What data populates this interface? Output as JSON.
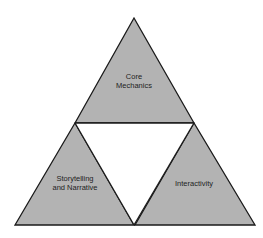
{
  "diagram": {
    "title": "",
    "fill_color": "#b3b3b3",
    "stroke_color": "#1a1a1a",
    "triangles": [
      {
        "id": "top",
        "label_lines": [
          "Core",
          "Mechanics"
        ]
      },
      {
        "id": "bottom-left",
        "label_lines": [
          "Storytelling",
          "and Narrative"
        ]
      },
      {
        "id": "bottom-right",
        "label_lines": [
          "Interactivity"
        ]
      }
    ],
    "center_gap": "empty inverted triangle"
  }
}
